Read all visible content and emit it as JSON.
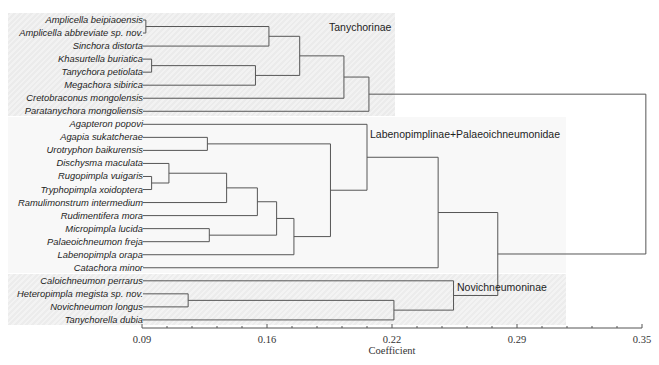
{
  "chart_data": {
    "type": "dendrogram",
    "title": "",
    "xlabel": "Coefficient",
    "ylabel": "",
    "xlim": [
      0.09,
      0.35
    ],
    "xticks": [
      "0.09",
      "0.16",
      "0.22",
      "0.29",
      "0.35"
    ],
    "grid": false,
    "legend": null,
    "orientation": "leaves left, root right",
    "leaves": [
      "Amplicella beipiaoensis",
      "Amplicella abbreviate sp. nov.",
      "Sinchora distorta",
      "Khasurtella buriatica",
      "Tanychora petiolata",
      "Megachora sibirica",
      "Cretobraconus mongolensis",
      "Paratanychora mongoliensis",
      "Agapteron popovi",
      "Agapia sukatcherae",
      "Urotryphon baikurensis",
      "Dischysma maculata",
      "Rugopimpla vuigaris",
      "Tryphopimpla xoidoptera",
      "Ramulimonstrum intermedium",
      "Rudimentifera mora",
      "Micropimpla lucida",
      "Palaeoichneumon freja",
      "Labenopimpla orapa",
      "Catachora minor",
      "Caloichneumon perrarus",
      "Heteropimpla megista sp. nov.",
      "Novichneumon longus",
      "Tanychorella dubia"
    ],
    "merges": [
      {
        "id": "n1",
        "children": [
          0,
          1
        ],
        "height": 0.092
      },
      {
        "id": "n2",
        "children": [
          "n1",
          2
        ],
        "height": 0.156
      },
      {
        "id": "n3",
        "children": [
          3,
          4
        ],
        "height": 0.095
      },
      {
        "id": "n4",
        "children": [
          "n3",
          5
        ],
        "height": 0.149
      },
      {
        "id": "n5",
        "children": [
          "n2",
          "n4"
        ],
        "height": 0.172
      },
      {
        "id": "n6",
        "children": [
          "n5",
          6
        ],
        "height": 0.195
      },
      {
        "id": "n7",
        "children": [
          "n6",
          7
        ],
        "height": 0.208
      },
      {
        "id": "n8",
        "children": [
          9,
          10
        ],
        "height": 0.124
      },
      {
        "id": "n9",
        "children": [
          12,
          13
        ],
        "height": 0.095
      },
      {
        "id": "n10",
        "children": [
          11,
          "n9"
        ],
        "height": 0.104
      },
      {
        "id": "n11",
        "children": [
          "n10",
          14
        ],
        "height": 0.134
      },
      {
        "id": "n12",
        "children": [
          "n11",
          15
        ],
        "height": 0.15
      },
      {
        "id": "n13",
        "children": [
          16,
          17
        ],
        "height": 0.125
      },
      {
        "id": "n14",
        "children": [
          "n12",
          "n13"
        ],
        "height": 0.16
      },
      {
        "id": "n15",
        "children": [
          "n14",
          18
        ],
        "height": 0.169
      },
      {
        "id": "n16",
        "children": [
          "n8",
          "n15"
        ],
        "height": 0.188
      },
      {
        "id": "n17",
        "children": [
          8,
          "n16"
        ],
        "height": 0.207
      },
      {
        "id": "n18",
        "children": [
          "n17",
          19
        ],
        "height": 0.244
      },
      {
        "id": "n19",
        "children": [
          21,
          22
        ],
        "height": 0.114
      },
      {
        "id": "n20",
        "children": [
          "n19",
          23
        ],
        "height": 0.221
      },
      {
        "id": "n21",
        "children": [
          20,
          "n20"
        ],
        "height": 0.252
      },
      {
        "id": "n22",
        "children": [
          "n18",
          "n21"
        ],
        "height": 0.275
      },
      {
        "id": "root",
        "children": [
          "n7",
          "n22"
        ],
        "height": 0.352
      }
    ],
    "clades": [
      {
        "name": "Tanychorinae",
        "leaf_range": [
          0,
          7
        ]
      },
      {
        "name": "Labenopimplinae+Palaeoichneumonidae",
        "leaf_range": [
          8,
          19
        ]
      },
      {
        "name": "Novichneumoninae",
        "leaf_range": [
          20,
          23
        ]
      }
    ]
  },
  "colors": {
    "branch_line": "#565656",
    "axis_line": "#555555",
    "band_tanychorinae": "#ededed",
    "band_labenopimplinae": "#f8f8f8",
    "band_novichneumoninae": "#efefef"
  }
}
